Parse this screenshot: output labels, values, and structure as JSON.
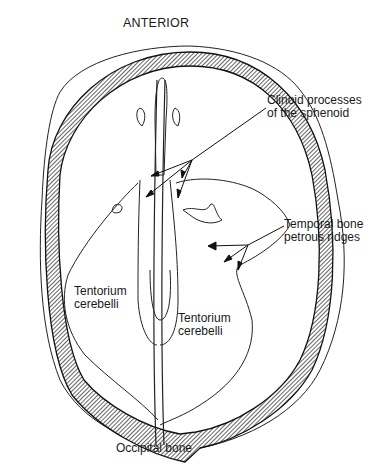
{
  "diagram": {
    "title": "ANTERIOR",
    "type": "anatomical illustration - skull base, superior view",
    "labels": [
      {
        "id": "clinoid",
        "lines": [
          "Clinoid processes",
          "of the sphenoid"
        ]
      },
      {
        "id": "temporal",
        "lines": [
          "Temporal bone",
          "petrous ridges"
        ]
      },
      {
        "id": "tentorium_left",
        "lines": [
          "Tentorium",
          "cerebelli"
        ]
      },
      {
        "id": "tentorium_right",
        "lines": [
          "Tentorium",
          "cerebelli"
        ]
      },
      {
        "id": "occipital",
        "lines": [
          "Occipital bone"
        ]
      }
    ],
    "colors": {
      "ink": "#1a1a1a",
      "background": "#ffffff"
    }
  }
}
